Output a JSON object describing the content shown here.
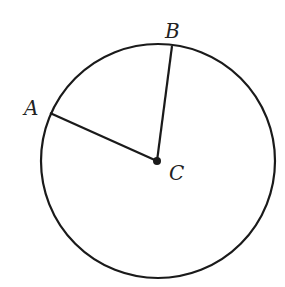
{
  "diagram": {
    "type": "circle-with-radii",
    "colors": {
      "stroke": "#1a1a1a",
      "background": "#ffffff",
      "text": "#222222"
    },
    "circle": {
      "cx": 158,
      "cy": 161,
      "r": 117
    },
    "center": {
      "label": "C",
      "x": 157,
      "y": 161
    },
    "points": [
      {
        "label": "A",
        "x": 50,
        "y": 113
      },
      {
        "label": "B",
        "x": 172,
        "y": 46
      }
    ],
    "labels": {
      "A": {
        "text": "A",
        "x": 24,
        "y": 115
      },
      "B": {
        "text": "B",
        "x": 165,
        "y": 38
      },
      "C": {
        "text": "C",
        "x": 169,
        "y": 180
      }
    },
    "segments": [
      {
        "from": "C",
        "to": "A"
      },
      {
        "from": "C",
        "to": "B"
      }
    ]
  }
}
